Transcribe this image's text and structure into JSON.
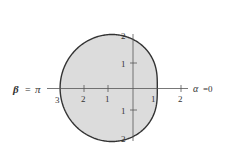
{
  "chart_data": {
    "type": "line",
    "title": "",
    "equation": "r = 2 - cos(theta)",
    "pole_px": [
      133,
      88
    ],
    "unit_px": 24.3,
    "axis_labels": {
      "left": "β = π",
      "right": "α = 0"
    },
    "x_ticks": [
      {
        "value": -3,
        "label": "3"
      },
      {
        "value": -2,
        "label": "2"
      },
      {
        "value": -1,
        "label": "1"
      },
      {
        "value": 1,
        "label": "1"
      },
      {
        "value": 2,
        "label": "2"
      }
    ],
    "y_ticks": [
      {
        "value": 2,
        "label": "2"
      },
      {
        "value": 1,
        "label": "1"
      },
      {
        "value": -1,
        "label": "1"
      },
      {
        "value": -2,
        "label": "2"
      }
    ],
    "fill_color": "#dcdcdc",
    "stroke_color": "#333333"
  },
  "labels": {
    "beta": "β",
    "eq1": "=",
    "pi": "π",
    "alpha": "α",
    "eq2": "=0",
    "x_neg3": "3",
    "x_neg2": "2",
    "x_neg1": "1",
    "x_pos1": "1",
    "x_pos2": "2",
    "y_pos2": "2",
    "y_pos1": "1",
    "y_neg1": "1",
    "y_neg2": "2"
  }
}
